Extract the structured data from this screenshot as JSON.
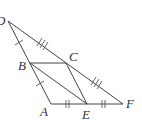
{
  "diagram": {
    "type": "geometry-figure",
    "points": {
      "D": {
        "label": "D",
        "x": 8,
        "y": 21
      },
      "B": {
        "label": "B",
        "x": 30,
        "y": 63
      },
      "C": {
        "label": "C",
        "x": 66,
        "y": 63
      },
      "A": {
        "label": "A",
        "x": 51,
        "y": 104
      },
      "E": {
        "label": "E",
        "x": 87,
        "y": 104
      },
      "F": {
        "label": "F",
        "x": 123,
        "y": 104
      }
    },
    "segments": [
      "DA",
      "DF",
      "AF",
      "BC",
      "BE",
      "CE"
    ],
    "equal_marks": [
      {
        "segments": [
          "DB",
          "BA"
        ],
        "ticks": 1
      },
      {
        "segments": [
          "AE",
          "EF"
        ],
        "ticks": 2
      },
      {
        "segments": [
          "DC",
          "CF"
        ],
        "ticks": 3
      }
    ],
    "colors": {
      "stroke": "#444444",
      "label": "#333333"
    }
  }
}
